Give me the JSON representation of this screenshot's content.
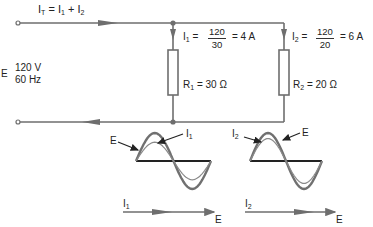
{
  "diagram": {
    "title_equation": {
      "lhs": "I",
      "lhs_sub": "T",
      "eq": "=",
      "t1": "I",
      "t1_sub": "1",
      "plus": "+",
      "t2": "I",
      "t2_sub": "2"
    },
    "source": {
      "label": "E",
      "voltage": "120 V",
      "frequency": "60 Hz"
    },
    "branch1": {
      "current_label": "I",
      "current_sub": "1",
      "eq": "=",
      "numerator": "120",
      "denominator": "30",
      "result": "= 4 A",
      "resistor_label": "R",
      "resistor_sub": "1",
      "resistor_value": "= 30 Ω"
    },
    "branch2": {
      "current_label": "I",
      "current_sub": "2",
      "eq": "=",
      "numerator": "120",
      "denominator": "20",
      "result": "= 6 A",
      "resistor_label": "R",
      "resistor_sub": "2",
      "resistor_value": "= 20 Ω"
    },
    "waveform1": {
      "voltage_label": "E",
      "current_label": "I",
      "current_sub": "1",
      "current_amplitude_ratio": 0.67
    },
    "waveform2": {
      "voltage_label": "E",
      "current_label": "I",
      "current_sub": "2",
      "current_amplitude_ratio": 0.8
    },
    "phasor1": {
      "current_label": "I",
      "current_sub": "1",
      "voltage_label": "E"
    },
    "phasor2": {
      "current_label": "I",
      "current_sub": "2",
      "voltage_label": "E"
    },
    "colors": {
      "wire": "#6e6e6e",
      "axis": "#222222",
      "text": "#222222"
    }
  }
}
